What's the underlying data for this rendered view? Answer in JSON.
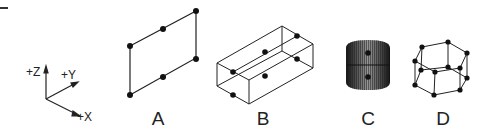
{
  "diagram": {
    "axes": {
      "labels": [
        "+Z",
        "+Y",
        "+X"
      ]
    },
    "figures": [
      {
        "id": "A",
        "label": "A",
        "shape": "parallelogram with 6 points"
      },
      {
        "id": "B",
        "label": "B",
        "shape": "wireframe rectangular box with 6 points"
      },
      {
        "id": "C",
        "label": "C",
        "shape": "shaded cylinder with 2 points"
      },
      {
        "id": "D",
        "label": "D",
        "shape": "wireframe hexagonal prism with 12 points"
      }
    ],
    "colors": {
      "line": "#222222",
      "point": "#111111",
      "background": "#ffffff"
    }
  }
}
